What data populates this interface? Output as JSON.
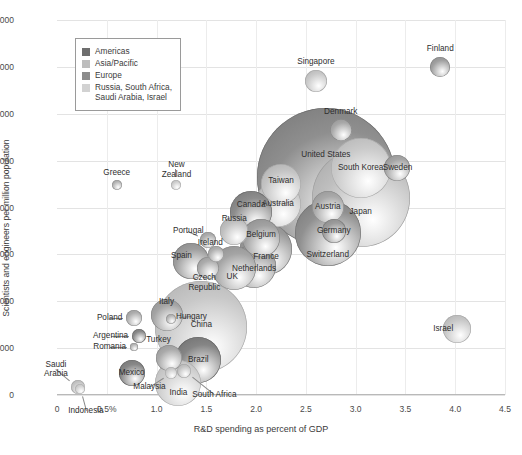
{
  "chart_data": {
    "type": "scatter",
    "title": "",
    "xlabel": "R&D spending as percent of GDP",
    "ylabel": "Scientists and engineers per million population",
    "xlim": [
      0,
      4.5
    ],
    "ylim": [
      0,
      8000
    ],
    "xticks": [
      "0",
      "0.5%",
      "1.0",
      "1.5",
      "2.0",
      "2.5",
      "3.0",
      "3.5",
      "4.0",
      "4.5"
    ],
    "xtick_values": [
      0,
      0.5,
      1.0,
      1.5,
      2.0,
      2.5,
      3.0,
      3.5,
      4.0,
      4.5
    ],
    "yticks": [
      "0",
      "1,000",
      "2,000",
      "3,000",
      "4,000",
      "5,000",
      "6,000",
      "7,000",
      "8,000"
    ],
    "ytick_values": [
      0,
      1000,
      2000,
      3000,
      4000,
      5000,
      6000,
      7000,
      8000
    ],
    "grid": true,
    "size_meaning": "bubble area scales with total national R&D spending",
    "legend": {
      "position": "top-left",
      "entries": [
        {
          "label": "Americas",
          "color": "#6e6e6e"
        },
        {
          "label": "Asia/Pacific",
          "color": "#bdbdbd"
        },
        {
          "label": "Europe",
          "color": "#8c8c8c"
        },
        {
          "label": "Russia, South Africa,\nSaudi Arabia, Israel",
          "color": "#d2d2d2"
        }
      ]
    },
    "points": [
      {
        "name": "Singapore",
        "x": 2.6,
        "y": 6700,
        "r": 11,
        "group": "Asia/Pacific",
        "color": "#c9c9c9",
        "label_dx": 0,
        "label_dy": -19
      },
      {
        "name": "Finland",
        "x": 3.85,
        "y": 7000,
        "r": 10,
        "group": "Europe",
        "color": "#a0a0a0",
        "label_dx": 0,
        "label_dy": -18
      },
      {
        "name": "Denmark",
        "x": 2.85,
        "y": 5650,
        "r": 11,
        "group": "Europe",
        "color": "#a8a8a8",
        "label_dx": 0,
        "label_dy": -18
      },
      {
        "name": "United States",
        "x": 2.7,
        "y": 4650,
        "r": 69,
        "group": "Americas",
        "color": "#8f8f8f",
        "label_dx": 0,
        "label_dy": -22
      },
      {
        "name": "South Korea",
        "x": 3.05,
        "y": 4850,
        "r": 30,
        "group": "Asia/Pacific",
        "color": "#cacaca",
        "label_dx": 0,
        "label_dy": 0
      },
      {
        "name": "Sweden",
        "x": 3.42,
        "y": 4840,
        "r": 13,
        "group": "Europe",
        "color": "#a6a6a6",
        "label_dx": 0,
        "label_dy": 0
      },
      {
        "name": "Japan",
        "x": 3.05,
        "y": 4200,
        "r": 49,
        "group": "Asia/Pacific",
        "color": "#bfbfbf",
        "label_dx": 0,
        "label_dy": 14
      },
      {
        "name": "Taiwan",
        "x": 2.25,
        "y": 4500,
        "r": 20,
        "group": "Asia/Pacific",
        "color": "#c4c4c4",
        "label_dx": 0,
        "label_dy": -3
      },
      {
        "name": "Australia",
        "x": 2.22,
        "y": 4080,
        "r": 23,
        "group": "Asia/Pacific",
        "color": "#c6c6c6",
        "label_dx": 0,
        "label_dy": 0
      },
      {
        "name": "Austria",
        "x": 2.72,
        "y": 4020,
        "r": 16,
        "group": "Europe",
        "color": "#a9a9a9",
        "label_dx": 0,
        "label_dy": 0
      },
      {
        "name": "Germany",
        "x": 2.78,
        "y": 3500,
        "r": 12,
        "group": "Europe",
        "color": "#9c9c9c",
        "label_dx": 0,
        "label_dy": 0
      },
      {
        "name": "Switzerland",
        "x": 2.72,
        "y": 3450,
        "r": 33,
        "group": "Europe",
        "color": "#909090",
        "label_dx": 0,
        "label_dy": 22
      },
      {
        "name": "Canada",
        "x": 1.95,
        "y": 3900,
        "r": 21,
        "group": "Americas",
        "color": "#8d8d8d",
        "label_dx": 0,
        "label_dy": -7
      },
      {
        "name": "Russia",
        "x": 1.78,
        "y": 3500,
        "r": 14,
        "group": "Russia",
        "color": "#c0c0c0",
        "label_dx": 0,
        "label_dy": -12
      },
      {
        "name": "Belgium",
        "x": 2.05,
        "y": 3350,
        "r": 19,
        "group": "Europe",
        "color": "#a2a2a2",
        "label_dx": 0,
        "label_dy": -3
      },
      {
        "name": "France",
        "x": 2.1,
        "y": 3120,
        "r": 26,
        "group": "Europe",
        "color": "#999999",
        "label_dx": 0,
        "label_dy": 8
      },
      {
        "name": "Portugal",
        "x": 1.52,
        "y": 3300,
        "r": 8,
        "group": "Europe",
        "color": "#adadad",
        "label_dx": -20,
        "label_dy": -9
      },
      {
        "name": "Ireland",
        "x": 1.6,
        "y": 3000,
        "r": 8,
        "group": "Europe",
        "color": "#b0b0b0",
        "label_dx": -6,
        "label_dy": -11
      },
      {
        "name": "Spain",
        "x": 1.35,
        "y": 2850,
        "r": 18,
        "group": "Europe",
        "color": "#9e9e9e",
        "label_dx": -10,
        "label_dy": -5
      },
      {
        "name": "Netherlands",
        "x": 1.98,
        "y": 2750,
        "r": 22,
        "group": "Europe",
        "color": "#9b9b9b",
        "label_dx": 0,
        "label_dy": 3
      },
      {
        "name": "UK",
        "x": 1.78,
        "y": 2700,
        "r": 22,
        "group": "Europe",
        "color": "#a4a4a4",
        "label_dx": -2,
        "label_dy": 9
      },
      {
        "name": "Czech\nRepublic",
        "x": 1.52,
        "y": 2700,
        "r": 11,
        "group": "Europe",
        "color": "#acacac",
        "label_dx": -4,
        "label_dy": 14
      },
      {
        "name": "China",
        "x": 1.45,
        "y": 1450,
        "r": 46,
        "group": "Asia/Pacific",
        "color": "#c8c8c8",
        "label_dx": 0,
        "label_dy": -2
      },
      {
        "name": "Italy",
        "x": 1.1,
        "y": 1700,
        "r": 16,
        "group": "Europe",
        "color": "#a5a5a5",
        "label_dx": 0,
        "label_dy": -13
      },
      {
        "name": "Hungary",
        "x": 1.15,
        "y": 1620,
        "r": 5,
        "group": "Europe",
        "color": "#b5b5b5",
        "label_dx": 20,
        "label_dy": -2
      },
      {
        "name": "Poland",
        "x": 0.77,
        "y": 1650,
        "r": 8,
        "group": "Europe",
        "color": "#aeaeae",
        "label_dx": -24,
        "label_dy": 0
      },
      {
        "name": "Argentina",
        "x": 0.82,
        "y": 1250,
        "r": 7,
        "group": "Americas",
        "color": "#8a8a8a",
        "label_dx": -28,
        "label_dy": 0
      },
      {
        "name": "Romania",
        "x": 0.77,
        "y": 1020,
        "r": 4,
        "group": "Europe",
        "color": "#b2b2b2",
        "label_dx": -24,
        "label_dy": 0
      },
      {
        "name": "Turkey",
        "x": 1.12,
        "y": 790,
        "r": 13,
        "group": "Europe",
        "color": "#aaaaaa",
        "label_dx": -10,
        "label_dy": -18
      },
      {
        "name": "Brazil",
        "x": 1.42,
        "y": 750,
        "r": 23,
        "group": "Americas",
        "color": "#858585",
        "label_dx": 0,
        "label_dy": 0
      },
      {
        "name": "Mexico",
        "x": 0.75,
        "y": 480,
        "r": 13,
        "group": "Americas",
        "color": "#888888",
        "label_dx": 0,
        "label_dy": 0
      },
      {
        "name": "Malaysia",
        "x": 1.15,
        "y": 480,
        "r": 6,
        "group": "Asia/Pacific",
        "color": "#cbcbcb",
        "label_dx": -22,
        "label_dy": 14
      },
      {
        "name": "India",
        "x": 1.22,
        "y": 250,
        "r": 23,
        "group": "Asia/Pacific",
        "color": "#cdcdcd",
        "label_dx": 0,
        "label_dy": 10
      },
      {
        "name": "South Africa",
        "x": 1.28,
        "y": 520,
        "r": 7,
        "group": "Russia",
        "color": "#c3c3c3",
        "label_dx": 30,
        "label_dy": 24
      },
      {
        "name": "Saudi\nArabia",
        "x": 0.21,
        "y": 180,
        "r": 7,
        "group": "Russia",
        "color": "#c5c5c5",
        "label_dx": -22,
        "label_dy": -18
      },
      {
        "name": "Indonesia",
        "x": 0.23,
        "y": 120,
        "r": 5,
        "group": "Asia/Pacific",
        "color": "#cfcfcf",
        "label_dx": 6,
        "label_dy": 22
      },
      {
        "name": "Greece",
        "x": 0.6,
        "y": 4490,
        "r": 5,
        "group": "Europe",
        "color": "#b4b4b4",
        "label_dx": 0,
        "label_dy": -12
      },
      {
        "name": "New\nZealand",
        "x": 1.2,
        "y": 4480,
        "r": 5,
        "group": "Asia/Pacific",
        "color": "#cccccc",
        "label_dx": 0,
        "label_dy": -16
      },
      {
        "name": "Israel",
        "x": 4.02,
        "y": 1400,
        "r": 14,
        "group": "Russia",
        "color": "#c7c7c7",
        "label_dx": -14,
        "label_dy": 0
      }
    ]
  }
}
